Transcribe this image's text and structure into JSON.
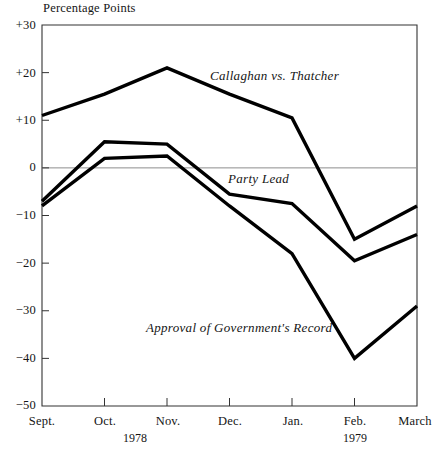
{
  "chart_data": {
    "type": "line",
    "title": "",
    "ylabel": "Percentage Points",
    "xlabel": "",
    "grid": false,
    "legend_position": "inline-annotations",
    "ylim": [
      -50,
      30
    ],
    "yticks": [
      30,
      20,
      10,
      0,
      -10,
      -20,
      -30,
      -40,
      -50
    ],
    "ytick_labels": [
      "+30",
      "+20",
      "+10",
      "0",
      "−10",
      "−20",
      "−30",
      "−40",
      "−50"
    ],
    "categories": [
      "Sept.",
      "Oct.",
      "Nov.",
      "Dec.",
      "Jan.",
      "Feb.",
      "March"
    ],
    "x_year_labels": [
      {
        "label": "1978",
        "under": "Oct."
      },
      {
        "label": "1979",
        "under": "Feb."
      }
    ],
    "zero_line": 0,
    "series": [
      {
        "name": "Callaghan vs. Thatcher",
        "values": [
          11,
          15.5,
          21,
          15.5,
          10.5,
          -15,
          -8
        ],
        "color": "#000000",
        "label_x": "Dec.",
        "label_value": 18
      },
      {
        "name": "Party Lead",
        "values": [
          -7,
          5.5,
          5,
          -5.5,
          -7.5,
          -19.5,
          -14
        ],
        "color": "#000000",
        "label_x": "Dec.",
        "label_value": -3.5
      },
      {
        "name": "Approval of Government's Record",
        "values": [
          -8,
          2,
          2.5,
          -8,
          -18,
          -40,
          -29
        ],
        "color": "#000000",
        "label_x": "Nov.",
        "label_value": -33
      }
    ]
  },
  "axis": {
    "y_title": "Percentage Points"
  },
  "annotations": {
    "callaghan": "Callaghan vs. Thatcher",
    "party_lead": "Party Lead",
    "approval": "Approval of Government's Record"
  },
  "xaxis": {
    "ticks": [
      "Sept.",
      "Oct.",
      "Nov.",
      "Dec.",
      "Jan.",
      "Feb.",
      "March"
    ],
    "year_1978": "1978",
    "year_1979": "1979"
  },
  "yaxis": {
    "t0": "+30",
    "t1": "+20",
    "t2": "+10",
    "t3": "0",
    "t4": "−10",
    "t5": "−20",
    "t6": "−30",
    "t7": "−40",
    "t8": "−50"
  }
}
